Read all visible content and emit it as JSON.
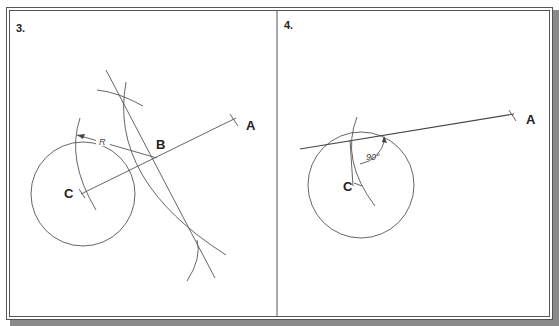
{
  "panels": [
    {
      "label": "3.",
      "points": {
        "A": "A",
        "B": "B",
        "C": "C"
      },
      "radius_label": "R"
    },
    {
      "label": "4.",
      "points": {
        "A": "A",
        "C": "C"
      },
      "angle_label": "90°"
    }
  ],
  "colors": {
    "line": "#555555",
    "text": "#222222",
    "shadow": "#8a8a8a",
    "background": "#ffffff"
  }
}
